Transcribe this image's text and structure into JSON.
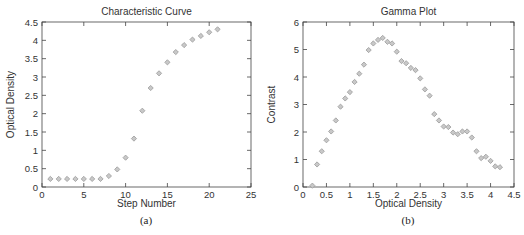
{
  "chart_data": [
    {
      "type": "scatter",
      "title": "Characteristic Curve",
      "xlabel": "Step Number",
      "ylabel": "Optical Density",
      "caption": "(a)",
      "xlim": [
        0,
        25
      ],
      "ylim": [
        0,
        4.5
      ],
      "xticks": [
        0,
        5,
        10,
        15,
        20,
        25
      ],
      "yticks": [
        0,
        0.5,
        1,
        1.5,
        2,
        2.5,
        3,
        3.5,
        4,
        4.5
      ],
      "grid": false,
      "marker": "diamond",
      "marker_color": "#9a9a9a",
      "x": [
        1,
        2,
        3,
        4,
        5,
        6,
        7,
        8,
        9,
        10,
        11,
        12,
        13,
        14,
        15,
        16,
        17,
        18,
        19,
        20,
        21
      ],
      "y": [
        0.22,
        0.22,
        0.22,
        0.22,
        0.22,
        0.22,
        0.22,
        0.3,
        0.48,
        0.8,
        1.32,
        2.08,
        2.7,
        3.1,
        3.4,
        3.68,
        3.87,
        4.02,
        4.12,
        4.22,
        4.3
      ]
    },
    {
      "type": "scatter",
      "title": "Gamma Plot",
      "xlabel": "Optical Density",
      "ylabel": "Contrast",
      "caption": "(b)",
      "xlim": [
        0,
        4.5
      ],
      "ylim": [
        0,
        6
      ],
      "xticks": [
        0,
        0.5,
        1,
        1.5,
        2,
        2.5,
        3,
        3.5,
        4,
        4.5
      ],
      "yticks": [
        0,
        1,
        2,
        3,
        4,
        5,
        6
      ],
      "grid": false,
      "marker": "diamond",
      "marker_color": "#9a9a9a",
      "x": [
        0.2,
        0.3,
        0.4,
        0.5,
        0.6,
        0.7,
        0.8,
        0.9,
        1.0,
        1.1,
        1.2,
        1.3,
        1.4,
        1.5,
        1.6,
        1.7,
        1.8,
        1.9,
        2.0,
        2.1,
        2.2,
        2.3,
        2.4,
        2.5,
        2.6,
        2.7,
        2.8,
        2.9,
        3.0,
        3.1,
        3.2,
        3.3,
        3.4,
        3.5,
        3.6,
        3.7,
        3.8,
        3.9,
        4.0,
        4.1,
        4.2
      ],
      "y": [
        0.05,
        0.82,
        1.3,
        1.7,
        2.02,
        2.42,
        2.92,
        3.22,
        3.45,
        3.82,
        4.12,
        4.45,
        4.98,
        5.22,
        5.35,
        5.42,
        5.28,
        5.22,
        4.92,
        4.58,
        4.5,
        4.33,
        4.25,
        3.95,
        3.55,
        3.32,
        2.65,
        2.42,
        2.2,
        2.18,
        1.98,
        1.92,
        2.02,
        2.02,
        1.8,
        1.3,
        1.05,
        1.1,
        0.95,
        0.75,
        0.72
      ]
    }
  ]
}
